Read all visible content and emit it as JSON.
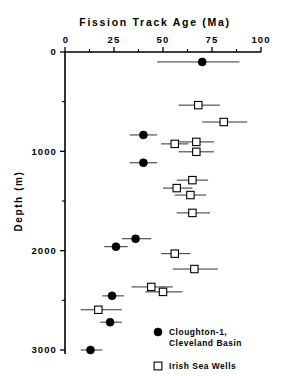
{
  "chart_data": {
    "type": "scatter",
    "title": "Fission Track Age (Ma)",
    "xlabel": "Fission Track Age (Ma)",
    "ylabel": "Depth (m)",
    "xlim": [
      0,
      100
    ],
    "ylim": [
      0,
      3000
    ],
    "x_ticks": [
      0,
      25,
      50,
      75,
      100
    ],
    "x_tick_labels": [
      "0",
      "25",
      "50",
      "75",
      "100"
    ],
    "x_minor_ticks": [
      12.5,
      37.5,
      62.5,
      87.5
    ],
    "y_ticks": [
      0,
      1000,
      2000,
      3000
    ],
    "y_tick_labels": [
      "0",
      "1000",
      "2000",
      "3000"
    ],
    "y_minor_ticks": [
      500,
      1500,
      2500
    ],
    "grid": false,
    "axis_direction": "y-inverted-depth",
    "legend_position": "bottom-right",
    "series": [
      {
        "name": "Cloughton-1, Cleveland Basin",
        "marker": "filled-circle",
        "color": "#000000",
        "points": [
          {
            "age": 70,
            "depth": 100,
            "err_low": 47,
            "err_high": 89
          },
          {
            "age": 40,
            "depth": 835,
            "err_low": 33,
            "err_high": 47
          },
          {
            "age": 40,
            "depth": 1115,
            "err_low": 33,
            "err_high": 47
          },
          {
            "age": 36,
            "depth": 1880,
            "err_low": 29,
            "err_high": 44
          },
          {
            "age": 26,
            "depth": 1960,
            "err_low": 20,
            "err_high": 32
          },
          {
            "age": 24,
            "depth": 2455,
            "err_low": 19,
            "err_high": 30
          },
          {
            "age": 23,
            "depth": 2720,
            "err_low": 18,
            "err_high": 29
          },
          {
            "age": 13,
            "depth": 3000,
            "err_low": 8,
            "err_high": 19
          }
        ]
      },
      {
        "name": "Irish Sea Wells",
        "marker": "open-square",
        "color": "#000000",
        "points": [
          {
            "age": 68,
            "depth": 535,
            "err_low": 58,
            "err_high": 79
          },
          {
            "age": 81,
            "depth": 705,
            "err_low": 70,
            "err_high": 93
          },
          {
            "age": 56,
            "depth": 925,
            "err_low": 49,
            "err_high": 63
          },
          {
            "age": 67,
            "depth": 905,
            "err_low": 58,
            "err_high": 76
          },
          {
            "age": 67,
            "depth": 1005,
            "err_low": 58,
            "err_high": 76
          },
          {
            "age": 65,
            "depth": 1290,
            "err_low": 57,
            "err_high": 73
          },
          {
            "age": 57,
            "depth": 1370,
            "err_low": 50,
            "err_high": 65
          },
          {
            "age": 64,
            "depth": 1440,
            "err_low": 56,
            "err_high": 72
          },
          {
            "age": 65,
            "depth": 1620,
            "err_low": 57,
            "err_high": 74
          },
          {
            "age": 56,
            "depth": 2030,
            "err_low": 49,
            "err_high": 64
          },
          {
            "age": 66,
            "depth": 2185,
            "err_low": 55,
            "err_high": 78
          },
          {
            "age": 44,
            "depth": 2365,
            "err_low": 34,
            "err_high": 55
          },
          {
            "age": 50,
            "depth": 2415,
            "err_low": 41,
            "err_high": 60
          },
          {
            "age": 17,
            "depth": 2595,
            "err_low": 8,
            "err_high": 29
          }
        ]
      }
    ],
    "legend": [
      {
        "label_line1": "Cloughton-1,",
        "label_line2": "Cleveland Basin",
        "marker": "filled-circle"
      },
      {
        "label_line1": "Irish Sea Wells",
        "label_line2": "",
        "marker": "open-square"
      }
    ]
  },
  "icons": {
    "filled_circle": "filled-circle-marker-icon",
    "open_square": "open-square-marker-icon"
  }
}
